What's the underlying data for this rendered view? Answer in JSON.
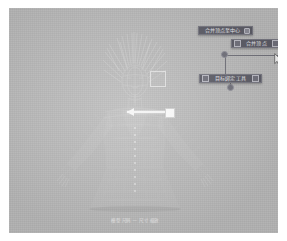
{
  "app": {
    "kind": "3d-garment-pattern-editor",
    "viewport_background": "#b9b9b9",
    "page_background": "#ffffff"
  },
  "viewport": {
    "subject": "avatar-with-wireframe-dress",
    "caption": "模型 尺码 — 尺寸 缩放"
  },
  "gizmo": {
    "name": "move-arrow-gizmo",
    "color": "#f4f4f4",
    "axis": "x"
  },
  "marker": {
    "name": "selection-square",
    "color": "#ffffff"
  },
  "node_graph": {
    "edge_color": "#6f6f78",
    "node_color": "#6e6e78",
    "panels": [
      {
        "id": "merge-center",
        "label": "合并顶点至中心",
        "has_checkbox": false,
        "has_dot": true
      },
      {
        "id": "merge-point",
        "label": "合并顶点",
        "has_checkbox": true,
        "has_dot": true
      },
      {
        "id": "align-tool",
        "label": "目标绑定工具",
        "has_checkbox": true,
        "has_dot": true
      }
    ],
    "nodes": [
      {
        "id": "node-a",
        "x": 212,
        "y": 43
      },
      {
        "id": "node-b",
        "x": 218,
        "y": 76
      }
    ]
  },
  "cursor": {
    "name": "mouse-pointer",
    "x": 265,
    "y": 44,
    "color": "#f0f0f0"
  }
}
